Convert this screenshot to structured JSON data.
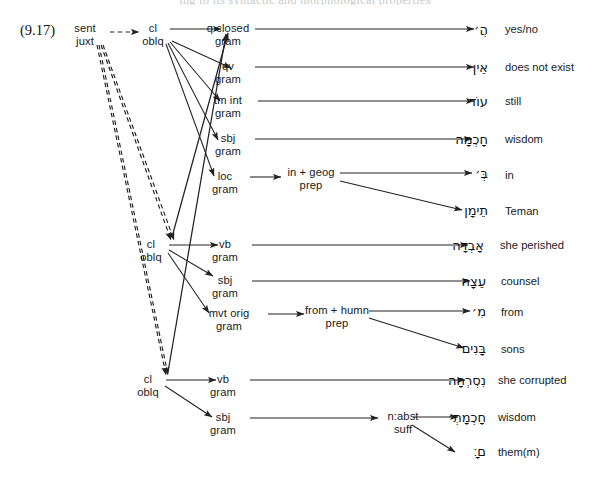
{
  "figure": {
    "number": "(9.17)",
    "partial_top_line": "ing to its syntactic and morphological properties",
    "caption_present": false
  },
  "colors": {
    "ink": "#1a1a1a",
    "line": "#222222",
    "background": "#ffffff",
    "faded": "#c9c9c9"
  },
  "root": {
    "l1": "sent",
    "l2": "juxt",
    "name": "sentence-juxtaposition"
  },
  "clauses": [
    {
      "id": "cl1",
      "l1": "cl",
      "l2": "oblq",
      "children": [
        {
          "id": "c1a",
          "l1": "q closed",
          "l2": "gram",
          "heb": "הֲ׳",
          "gloss": "yes/no"
        },
        {
          "id": "c1b",
          "l1": "qv",
          "l2": "gram",
          "heb": "אֵין",
          "gloss": "does not exist"
        },
        {
          "id": "c1c",
          "l1": "tm int",
          "l2": "gram",
          "heb": "עוֹד",
          "gloss": "still"
        },
        {
          "id": "c1d",
          "l1": "sbj",
          "l2": "gram",
          "heb": "חָכְמָה",
          "gloss": "wisdom"
        },
        {
          "id": "c1e",
          "l1": "loc",
          "l2": "gram",
          "mid": {
            "l1": "in + geog",
            "l2": "prep"
          },
          "leaves": [
            {
              "heb": "בְּ׳",
              "gloss": "in"
            },
            {
              "heb": "תֵימָן",
              "gloss": "Teman"
            }
          ]
        }
      ]
    },
    {
      "id": "cl2",
      "l1": "cl",
      "l2": "oblq",
      "children": [
        {
          "id": "c2a",
          "l1": "vb",
          "l2": "gram",
          "heb": "אָבְדָה",
          "gloss": "she perished"
        },
        {
          "id": "c2b",
          "l1": "sbj",
          "l2": "gram",
          "heb": "עֵצָה",
          "gloss": "counsel"
        },
        {
          "id": "c2c",
          "l1": "mvt orig",
          "l2": "gram",
          "mid": {
            "l1": "from + humn",
            "l2": "prep"
          },
          "leaves": [
            {
              "heb": "מִ׳",
              "gloss": "from"
            },
            {
              "heb": "בָּנִים",
              "gloss": "sons"
            }
          ]
        }
      ]
    },
    {
      "id": "cl3",
      "l1": "cl",
      "l2": "oblq",
      "children": [
        {
          "id": "c3a",
          "l1": "vb",
          "l2": "gram",
          "heb": "נִסְרְחָה",
          "gloss": "she corrupted"
        },
        {
          "id": "c3b",
          "l1": "sbj",
          "l2": "gram",
          "mid": {
            "l1": "n:abst",
            "l2": "suff"
          },
          "leaves": [
            {
              "heb": "חָכְמָתְ׳",
              "gloss": "wisdom"
            },
            {
              "heb": "ם׃ָ",
              "gloss": "them(m)"
            }
          ]
        }
      ]
    }
  ],
  "edges": {
    "dashed_label": "sentence-juxtaposition-link",
    "solid_label": "constituent-link",
    "nested_label": "embedded-clause-link"
  }
}
